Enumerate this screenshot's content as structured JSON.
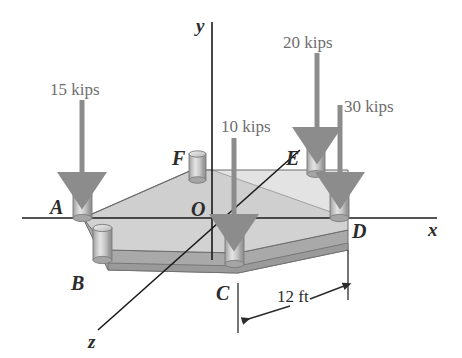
{
  "figure": {
    "colors": {
      "plate_top": "#d2d2d2",
      "plate_top_back": "#c9c9c9",
      "plate_edge": "#a9a9a9",
      "plate_edge_dark": "#9a9a9a",
      "column_body": "#bdbdbd",
      "column_light": "#e2e2e2",
      "column_dark": "#8f8f8f",
      "outline": "#4a4a4a",
      "axis": "#1a1a1a",
      "arrow": "#8c8c8c",
      "label": "#2b2b2b",
      "load_label": "#6e6e6e",
      "background": "#ffffff"
    }
  },
  "axes": [
    {
      "id": "y-axis",
      "label": "y",
      "label_x": 196,
      "label_y": 32
    },
    {
      "id": "x-axis",
      "label": "x",
      "label_x": 428,
      "label_y": 236
    },
    {
      "id": "z-axis",
      "label": "z",
      "label_x": 88,
      "label_y": 348
    }
  ],
  "origin": {
    "label": "O",
    "x": 191,
    "y": 216
  },
  "points": [
    {
      "id": "point-a",
      "label": "A",
      "label_x": 50,
      "label_y": 214
    },
    {
      "id": "point-b",
      "label": "B",
      "label_x": 71,
      "label_y": 290
    },
    {
      "id": "point-c",
      "label": "C",
      "label_x": 216,
      "label_y": 300
    },
    {
      "id": "point-d",
      "label": "D",
      "label_x": 352,
      "label_y": 238
    },
    {
      "id": "point-e",
      "label": "E",
      "label_x": 286,
      "label_y": 165
    },
    {
      "id": "point-f",
      "label": "F",
      "label_x": 172,
      "label_y": 165
    }
  ],
  "loads": [
    {
      "id": "load-15-kips",
      "label": "15 kips",
      "label_x": 50,
      "label_y": 95,
      "shaft_x": 82,
      "top_y": 100,
      "tip_y": 188,
      "at_point": "A"
    },
    {
      "id": "load-10-kips",
      "label": "10 kips",
      "label_x": 221,
      "label_y": 132,
      "shaft_x": 234,
      "top_y": 138,
      "tip_y": 230,
      "at_point": "C"
    },
    {
      "id": "load-20-kips",
      "label": "20 kips",
      "label_x": 283,
      "label_y": 48,
      "shaft_x": 317,
      "top_y": 53,
      "tip_y": 143,
      "at_point": "E"
    },
    {
      "id": "load-30-kips",
      "label": "30 kips",
      "label_x": 344,
      "label_y": 112,
      "shaft_x": 340,
      "top_y": 105,
      "tip_y": 188,
      "at_point": "D"
    }
  ],
  "dimensions": [
    {
      "id": "dimension-12-ft",
      "label": "12 ft",
      "label_x": 277,
      "label_y": 302,
      "from_x": 238,
      "to_x": 348
    }
  ]
}
